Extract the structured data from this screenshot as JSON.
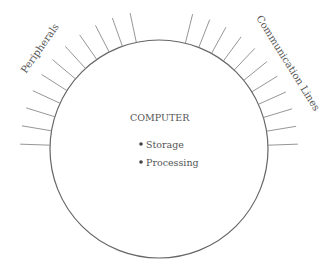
{
  "diagram": {
    "center_title": "COMPUTER",
    "bullets": [
      "Storage",
      "Processing"
    ],
    "left_label": "Peripherals",
    "right_label": "Communication Lines",
    "circle": {
      "cx": 159,
      "cy": 149,
      "r": 109
    },
    "left_tick_count": 11,
    "right_tick_count": 11,
    "line_color": "#666666",
    "tick_color": "#8a8a8a"
  }
}
